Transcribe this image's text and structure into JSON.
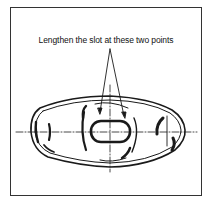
{
  "diagram": {
    "caption": "Lengthen the slot at these two points",
    "line_color": "#1a1a1a",
    "background": "#ffffff"
  }
}
